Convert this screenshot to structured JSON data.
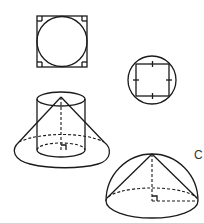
{
  "figures": {
    "square_with_inscribed_circle": {
      "label": ""
    },
    "circle_with_inscribed_square": {
      "label": ""
    },
    "cone_and_cylinder": {
      "label": ""
    },
    "hemisphere_with_cone": {
      "label": "C"
    }
  },
  "colors": {
    "stroke": "#1a1a1a",
    "background": "#ffffff"
  }
}
